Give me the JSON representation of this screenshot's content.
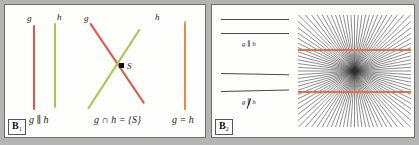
{
  "figure": {
    "background_color": "#b4b4b4",
    "panel_background": "#fdfdfc",
    "colors": {
      "line_g": "#e2554b",
      "line_h": "#a4ca4e",
      "line_coincident": "#e8893f",
      "hering_line": "#e2724a",
      "fan_line": "#2e2e2e",
      "gray_line": "#4a4a4a",
      "border": "#6f6f6f"
    }
  },
  "panel_b1": {
    "tag": "B",
    "tag_sub": "1",
    "cases": [
      {
        "name": "parallel",
        "label_g": "g",
        "label_h": "h",
        "caption": "g ∥ h"
      },
      {
        "name": "intersecting",
        "label_g": "g",
        "label_h": "h",
        "point_label": "S",
        "caption": "g ∩ h = {S}"
      },
      {
        "name": "coincident",
        "label_g": "",
        "label_h": "",
        "caption": "g = h"
      }
    ]
  },
  "panel_b2": {
    "tag": "B",
    "tag_sub": "2",
    "examples": [
      {
        "name": "parallel-pair",
        "caption_g": "g",
        "caption_sep": "∥",
        "caption_h": "h"
      },
      {
        "name": "nonparallel-pair",
        "caption_g": "g",
        "caption_sep": "∥",
        "caption_h": "h",
        "negated": true
      }
    ],
    "illusion": {
      "name": "hering-illusion",
      "fan_ray_count": 96,
      "overlay_line_count": 2
    }
  }
}
